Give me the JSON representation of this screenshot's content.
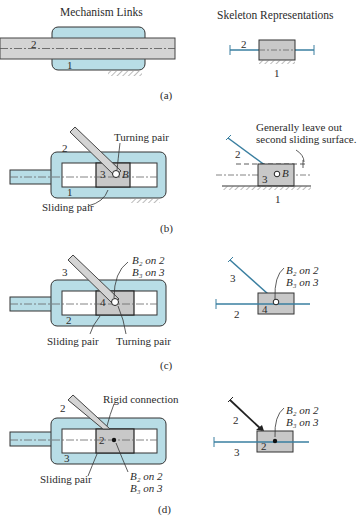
{
  "headers": {
    "left": "Mechanism Links",
    "right": "Skeleton Representations"
  },
  "colors": {
    "housing_fill": "#b8dde6",
    "rod_fill": "#d4d4d4",
    "block_fill": "#c8c8c8",
    "skeleton_line": "#3a7fa0",
    "outline": "#333333"
  },
  "panels": [
    {
      "caption": "(a)",
      "mechanism_labels": {
        "rod": "2",
        "frame": "1"
      },
      "skeleton_labels": {
        "rod": "2",
        "ground": "1"
      }
    },
    {
      "caption": "(b)",
      "mechanism_labels": {
        "link": "2",
        "block": "3",
        "frame": "1",
        "point": "B",
        "turning_pair": "Turning pair",
        "sliding_pair": "Sliding pair"
      },
      "skeleton_labels": {
        "link": "2",
        "block": "3",
        "point": "B",
        "ground": "1",
        "note_line1": "Generally leave out",
        "note_line2": "second sliding surface."
      }
    },
    {
      "caption": "(c)",
      "mechanism_labels": {
        "link": "3",
        "block": "4",
        "frame": "2",
        "b2": "B₂ on 2",
        "b3": "B₃ on 3",
        "sliding_pair": "Sliding pair",
        "turning_pair": "Turning pair"
      },
      "skeleton_labels": {
        "link": "3",
        "block": "4",
        "rod": "2",
        "b2": "B₂ on 2",
        "b3": "B₃ on 3"
      }
    },
    {
      "caption": "(d)",
      "mechanism_labels": {
        "link": "2",
        "block": "2",
        "frame": "3",
        "rigid": "Rigid connection",
        "sliding_pair": "Sliding pair",
        "b2": "B₂ on 2",
        "b3": "B₃ on 3"
      },
      "skeleton_labels": {
        "link": "2",
        "block": "2",
        "rod": "3",
        "b2": "B₂ on 2",
        "b3": "B₃ on 3"
      }
    }
  ]
}
